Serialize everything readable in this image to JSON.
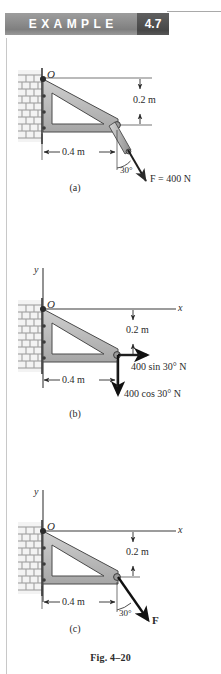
{
  "header": {
    "example_label": "EXAMPLE",
    "example_number": "4.7",
    "band_color": "#8e8e8e",
    "number_box_color": "#4f4f4f",
    "rule_color": "#a9a9a9"
  },
  "figure": {
    "caption": "Fig. 4–20",
    "plate_color": "#b9b9b9",
    "line_color": "#3a3a3a",
    "panels": [
      {
        "id": "a",
        "sublabel": "(a)",
        "point_label": "O",
        "dim_vertical": "0.2 m",
        "dim_horizontal": "0.4 m",
        "angle_label": "30°",
        "force_label": "F = 400 N",
        "axes": []
      },
      {
        "id": "b",
        "sublabel": "(b)",
        "point_label": "O",
        "dim_vertical": "0.2 m",
        "dim_horizontal": "0.4 m",
        "component_x": "400 sin 30° N",
        "component_y": "400 cos 30° N",
        "axes": [
          "x",
          "y"
        ]
      },
      {
        "id": "c",
        "sublabel": "(c)",
        "point_label": "O",
        "dim_vertical": "0.2 m",
        "dim_horizontal": "0.4 m",
        "angle_label": "30°",
        "force_label": "F",
        "axes": [
          "x",
          "y"
        ]
      }
    ]
  }
}
